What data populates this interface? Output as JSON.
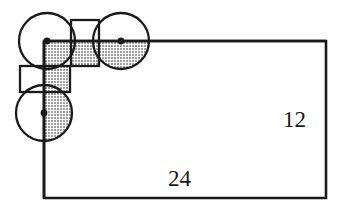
{
  "figure": {
    "background_color": "#ffffff",
    "stroke_color": "#1a1a1a",
    "shade_color": "#b8b8b8",
    "fill_color": "#ffffff",
    "labels": {
      "height": "12",
      "width": "24"
    },
    "rectangle": {
      "name": "main-rectangle",
      "left": 44,
      "top": 41,
      "right": 326,
      "bottom": 198,
      "stroke_width": 2.6
    },
    "circles": [
      {
        "name": "circle-top-left",
        "cx": 47,
        "cy": 41,
        "r": 28
      },
      {
        "name": "circle-top-right",
        "cx": 121,
        "cy": 41,
        "r": 28
      },
      {
        "name": "circle-bottom-left",
        "cx": 44,
        "cy": 113,
        "r": 28
      }
    ],
    "squares": [
      {
        "name": "square-vertical",
        "x": 71,
        "y": 20,
        "width": 28,
        "height": 46
      },
      {
        "name": "square-horizontal",
        "x": 20,
        "y": 66,
        "width": 50,
        "height": 26
      }
    ],
    "vertices": [
      {
        "name": "vertex-top-left",
        "cx": 47,
        "cy": 41,
        "r": 3.2
      },
      {
        "name": "vertex-top-right",
        "cx": 121,
        "cy": 41,
        "r": 3.2
      },
      {
        "name": "vertex-bottom-left",
        "cx": 44,
        "cy": 113,
        "r": 3.2
      }
    ],
    "axes": {
      "vertical_line_x": 44,
      "horizontal_line_y": 41
    }
  }
}
